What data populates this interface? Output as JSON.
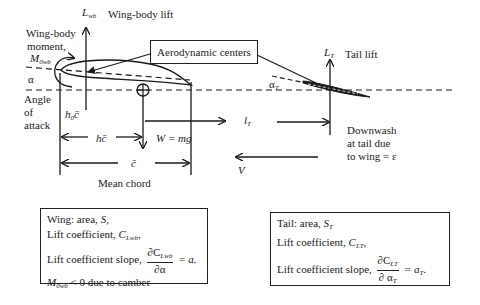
{
  "diagram": {
    "labels": {
      "wing_body_lift_symbol": "L",
      "wing_body_lift_sub": "wb",
      "wing_body_lift_text": "Wing-body lift",
      "wing_body_moment_line1": "Wing-body",
      "wing_body_moment_line2": "moment,",
      "wing_body_moment_symbol": "M",
      "wing_body_moment_sub": "0wb",
      "alpha": "α",
      "angle_of_attack_line1": "Angle",
      "angle_of_attack_line2": "of",
      "angle_of_attack_line3": "attack",
      "h0c": "h",
      "h0c_sub": "0",
      "h0c_cbar": "c̄",
      "hc": "hc̄",
      "weight": "W = mg",
      "cbar": "c̄",
      "mean_chord": "Mean chord",
      "aerodynamic_centers": "Aerodynamic centers",
      "tail_lift_symbol": "L",
      "tail_lift_sub": "T",
      "tail_lift_text": "Tail lift",
      "alpha_t": "α",
      "alpha_t_sub": "T",
      "lt": "l",
      "lt_sub": "T",
      "downwash_line1": "Downwash",
      "downwash_line2": "at tail due",
      "downwash_line3": "to wing = ε",
      "velocity": "V"
    },
    "wing_box": {
      "line1_text": "Wing: area, ",
      "line1_sym": "S",
      "line1_end": ",",
      "line2_text": "Lift coefficient,  ",
      "line2_sym": "C",
      "line2_sub": "Lwb",
      "line2_end": ",",
      "line3_text": "Lift coefficient slope, ",
      "line3_num": "∂C",
      "line3_num_sub": "Lwb",
      "line3_den": "∂α",
      "line3_end": " = a.",
      "line4_sym": "M",
      "line4_sub": "0wb",
      "line4_text": " < 0 due to camber"
    },
    "tail_box": {
      "line1_text": "Tail: area, ",
      "line1_sym": "S",
      "line1_sub": "T",
      "line2_text": "Lift coefficient, ",
      "line2_sym": "C",
      "line2_sub": "LT",
      "line2_end": ",",
      "line3_text": "Lift coefficient slope, ",
      "line3_num": "∂C",
      "line3_num_sub": "LT",
      "line3_den": "∂ α",
      "line3_den_sub": "T",
      "line3_end_pre": " = a",
      "line3_end_sub": "T",
      "line3_end": "."
    },
    "colors": {
      "line": "#1a1a1a",
      "background": "#ffffff"
    }
  }
}
